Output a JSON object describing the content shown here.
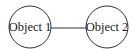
{
  "diagram": {
    "nodes": [
      {
        "id": "object-1",
        "label": "Object 1",
        "cx": 30,
        "cy": 27,
        "r": 21
      },
      {
        "id": "object-2",
        "label": "Object 2",
        "cx": 107,
        "cy": 27,
        "r": 21
      }
    ],
    "edges": [
      {
        "from": "object-1",
        "to": "object-2"
      }
    ],
    "colors": {
      "stroke": "#333333",
      "text": "#222222",
      "background": "#ffffff"
    }
  }
}
